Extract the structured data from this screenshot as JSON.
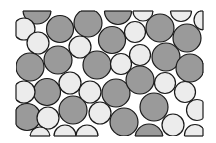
{
  "diagram": {
    "title": "",
    "frame": {
      "x": 16,
      "y": 11,
      "width": 187,
      "height": 125
    },
    "colors": {
      "gray": "#9a9a9a",
      "white": "#ececec",
      "stroke": "#1a1a1a",
      "background": "#ffffff"
    },
    "circles": [
      {
        "cx": 37,
        "cy": 10,
        "r": 14,
        "fill": "gray"
      },
      {
        "cx": 24,
        "cy": 29,
        "r": 11,
        "fill": "white"
      },
      {
        "cx": 60,
        "cy": 29,
        "r": 13.5,
        "fill": "gray"
      },
      {
        "cx": 88,
        "cy": 23,
        "r": 14,
        "fill": "gray"
      },
      {
        "cx": 118,
        "cy": 11,
        "r": 13.5,
        "fill": "gray"
      },
      {
        "cx": 143,
        "cy": 11,
        "r": 10,
        "fill": "white"
      },
      {
        "cx": 160,
        "cy": 28,
        "r": 14,
        "fill": "gray"
      },
      {
        "cx": 181,
        "cy": 11,
        "r": 10.5,
        "fill": "white"
      },
      {
        "cx": 204,
        "cy": 20,
        "r": 10,
        "fill": "white"
      },
      {
        "cx": 38,
        "cy": 43,
        "r": 11,
        "fill": "white"
      },
      {
        "cx": 80,
        "cy": 47,
        "r": 11,
        "fill": "white"
      },
      {
        "cx": 112,
        "cy": 40,
        "r": 13.5,
        "fill": "gray"
      },
      {
        "cx": 135,
        "cy": 32,
        "r": 10.5,
        "fill": "white"
      },
      {
        "cx": 187,
        "cy": 38,
        "r": 14,
        "fill": "gray"
      },
      {
        "cx": 140,
        "cy": 55,
        "r": 10.5,
        "fill": "white"
      },
      {
        "cx": 58,
        "cy": 60,
        "r": 14,
        "fill": "gray"
      },
      {
        "cx": 30,
        "cy": 67,
        "r": 14,
        "fill": "gray"
      },
      {
        "cx": 97,
        "cy": 65,
        "r": 14,
        "fill": "gray"
      },
      {
        "cx": 121,
        "cy": 64,
        "r": 10.5,
        "fill": "white"
      },
      {
        "cx": 166,
        "cy": 57,
        "r": 14,
        "fill": "gray"
      },
      {
        "cx": 190,
        "cy": 68,
        "r": 14,
        "fill": "gray"
      },
      {
        "cx": 70,
        "cy": 83,
        "r": 11,
        "fill": "white"
      },
      {
        "cx": 47,
        "cy": 92,
        "r": 13.5,
        "fill": "gray"
      },
      {
        "cx": 24,
        "cy": 92,
        "r": 11,
        "fill": "white"
      },
      {
        "cx": 90,
        "cy": 92,
        "r": 11,
        "fill": "white"
      },
      {
        "cx": 116,
        "cy": 93,
        "r": 14,
        "fill": "gray"
      },
      {
        "cx": 140,
        "cy": 80,
        "r": 14,
        "fill": "gray"
      },
      {
        "cx": 165,
        "cy": 83,
        "r": 10.5,
        "fill": "white"
      },
      {
        "cx": 185,
        "cy": 92,
        "r": 10.5,
        "fill": "white"
      },
      {
        "cx": 73,
        "cy": 110,
        "r": 14,
        "fill": "gray"
      },
      {
        "cx": 100,
        "cy": 113,
        "r": 11,
        "fill": "white"
      },
      {
        "cx": 154,
        "cy": 107,
        "r": 14,
        "fill": "gray"
      },
      {
        "cx": 197,
        "cy": 110,
        "r": 10.5,
        "fill": "white"
      },
      {
        "cx": 27,
        "cy": 117,
        "r": 13.5,
        "fill": "gray"
      },
      {
        "cx": 48,
        "cy": 118,
        "r": 11,
        "fill": "white"
      },
      {
        "cx": 124,
        "cy": 122,
        "r": 14,
        "fill": "gray"
      },
      {
        "cx": 173,
        "cy": 125,
        "r": 11,
        "fill": "white"
      },
      {
        "cx": 40,
        "cy": 137,
        "r": 10,
        "fill": "white"
      },
      {
        "cx": 65,
        "cy": 136,
        "r": 11,
        "fill": "white"
      },
      {
        "cx": 87,
        "cy": 136,
        "r": 11,
        "fill": "white"
      },
      {
        "cx": 149,
        "cy": 138,
        "r": 14,
        "fill": "gray"
      },
      {
        "cx": 195,
        "cy": 135,
        "r": 10.5,
        "fill": "white"
      }
    ]
  }
}
